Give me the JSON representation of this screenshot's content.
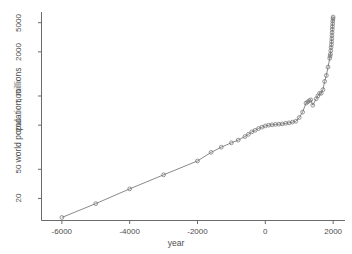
{
  "chart_data": {
    "type": "line",
    "title": "",
    "subtitle": "",
    "xlabel": "year",
    "ylabel": "world population, millions",
    "xlim": [
      -6600,
      2350
    ],
    "ylim_log": [
      10,
      7000
    ],
    "y_scale": "log",
    "x_scale": "linear",
    "grid": false,
    "legend": null,
    "marker": "open-circle",
    "marker_color": "#6b6b6b",
    "line_color": "#6b6b6b",
    "xticks": [
      -6000,
      -4000,
      -2000,
      0,
      2000
    ],
    "xtick_labels": [
      "-6000",
      "-4000",
      "-2000",
      "0",
      "2000"
    ],
    "yticks": [
      20,
      50,
      200,
      500,
      2000,
      5000
    ],
    "ytick_labels": [
      "20",
      "50",
      "200",
      "500",
      "2000",
      "5000"
    ],
    "x": [
      -6000,
      -5000,
      -4000,
      -3000,
      -2000,
      -1600,
      -1300,
      -1000,
      -800,
      -600,
      -500,
      -400,
      -300,
      -200,
      -100,
      0,
      100,
      200,
      300,
      400,
      500,
      600,
      700,
      800,
      900,
      1000,
      1100,
      1200,
      1250,
      1300,
      1340,
      1400,
      1500,
      1550,
      1600,
      1650,
      1700,
      1750,
      1800,
      1850,
      1900,
      1910,
      1920,
      1930,
      1940,
      1950,
      1955,
      1960,
      1965,
      1970,
      1975,
      1980,
      1985,
      1990,
      1995,
      1999
    ],
    "y": [
      11,
      17,
      27,
      42,
      65,
      85,
      100,
      115,
      125,
      140,
      150,
      162,
      170,
      180,
      188,
      195,
      200,
      202,
      205,
      206,
      208,
      212,
      215,
      220,
      226,
      254,
      301,
      400,
      416,
      432,
      443,
      374,
      458,
      500,
      545,
      545,
      610,
      791,
      954,
      1241,
      1634,
      1750,
      1860,
      2070,
      2300,
      2519,
      2756,
      3021,
      3335,
      3692,
      4068,
      4435,
      4831,
      5263,
      5674,
      5978
    ],
    "annotations": []
  },
  "axes": {
    "x_axis_name": "year-axis",
    "y_axis_name": "population-axis"
  }
}
